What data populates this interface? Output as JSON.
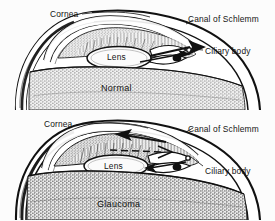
{
  "figure": {
    "background_color": "#fcfcfc",
    "ink_color": "#141414"
  },
  "panels": [
    {
      "id": "normal",
      "caption": "Normal",
      "caption_pos": {
        "x": 101,
        "y": 88
      },
      "labels": [
        {
          "name": "cornea",
          "text": "Cornea",
          "x": 50,
          "y": 9
        },
        {
          "name": "canal-of-schlemm",
          "text": "Canal of Schlemm",
          "x": 188,
          "y": 17
        },
        {
          "name": "ciliary-body",
          "text": "Ciliary body",
          "x": 205,
          "y": 52
        }
      ],
      "lens_label": {
        "text": "Lens",
        "x": 107,
        "y": 54
      },
      "flow": {
        "direction": "outward",
        "blocked": false,
        "description": "Aqueous humor drains freely through the canal of Schlemm"
      }
    },
    {
      "id": "glaucoma",
      "caption": "Glaucoma",
      "caption_pos": {
        "x": 97,
        "y": 199
      },
      "labels": [
        {
          "name": "cornea",
          "text": "Cornea",
          "x": 44,
          "y": 119
        },
        {
          "name": "canal-of-schlemm",
          "text": "Canal of Schlemm",
          "x": 188,
          "y": 129
        },
        {
          "name": "ciliary-body",
          "text": "Ciliary body",
          "x": 205,
          "y": 166
        }
      ],
      "lens_label": {
        "text": "Lens",
        "x": 104,
        "y": 162
      },
      "flow": {
        "direction": "blocked-backflow",
        "blocked": true,
        "description": "Drainage angle is closed; aqueous humor backs up raising intraocular pressure"
      }
    }
  ]
}
